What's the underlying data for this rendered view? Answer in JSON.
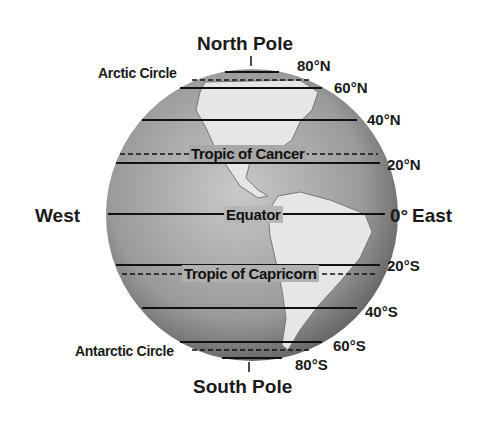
{
  "poles": {
    "north": "North Pole",
    "south": "South Pole"
  },
  "directions": {
    "west": "West",
    "east": "East"
  },
  "lines": {
    "n80": "80°N",
    "n60": "60°N",
    "n40": "40°N",
    "n20": "20°N",
    "eq": "0°",
    "s20": "20°S",
    "s40": "40°S",
    "s60": "60°S",
    "s80": "80°S"
  },
  "named_circles": {
    "arctic": "Arctic Circle",
    "cancer": "Tropic of Cancer",
    "equator": "Equator",
    "capricorn": "Tropic of Capricorn",
    "antarctic": "Antarctic Circle"
  },
  "colors": {
    "globe_dark": "#6f6f6f",
    "globe_light": "#d6d6d6",
    "land": "#e9e9e9",
    "line": "#111111"
  }
}
